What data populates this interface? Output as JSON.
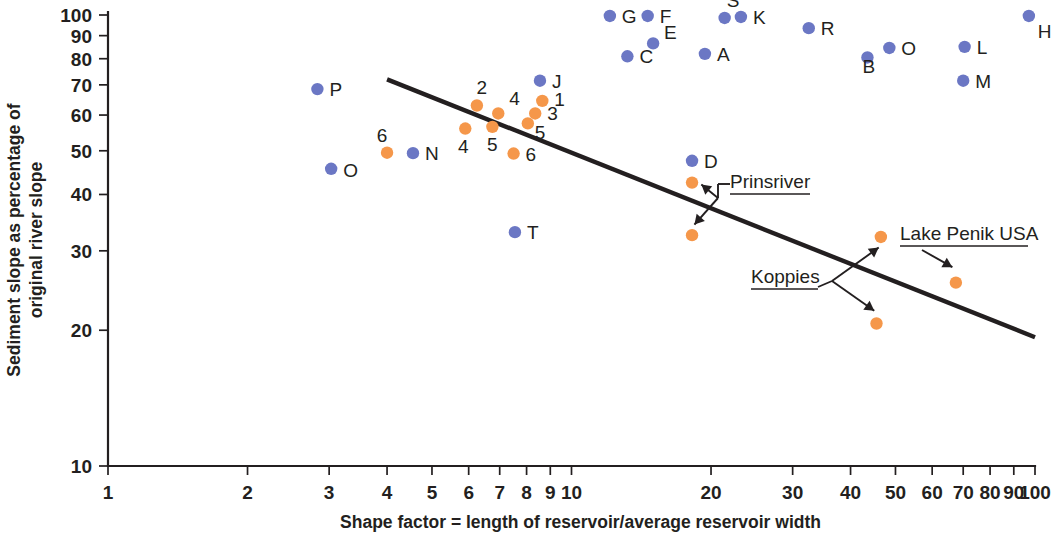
{
  "chart_data": {
    "type": "scatter",
    "title": "",
    "xlabel": "Shape factor = length of reservoir/average reservoir width",
    "ylabel": "Sediment slope as percentage of original river slope",
    "xscale": "log",
    "yscale": "log",
    "xlim": [
      1,
      100
    ],
    "ylim": [
      10,
      100
    ],
    "grid": false,
    "legend": "none",
    "xticks": [
      1,
      2,
      3,
      4,
      5,
      6,
      7,
      8,
      9,
      10,
      20,
      30,
      40,
      50,
      60,
      70,
      80,
      90,
      100
    ],
    "xticklabels": [
      "1",
      "2",
      "3",
      "4",
      "5",
      "6",
      "7",
      "8",
      "9",
      "10",
      "20",
      "30",
      "40",
      "50",
      "60",
      "70",
      "80",
      "90",
      "100"
    ],
    "yticks": [
      10,
      20,
      30,
      40,
      50,
      60,
      70,
      80,
      90,
      100
    ],
    "yticklabels": [
      "10",
      "20",
      "30",
      "40",
      "50",
      "60",
      "70",
      "80",
      "90",
      "100"
    ],
    "colors": {
      "blue": "#6b77c4",
      "orange": "#f5974a",
      "line": "#231f20"
    },
    "series": [
      {
        "name": "Lettered reservoirs",
        "color": "#6b77c4",
        "points": [
          {
            "label": "P",
            "x": 2.83,
            "y": 68.5
          },
          {
            "label": "O",
            "x": 3.03,
            "y": 45.6
          },
          {
            "label": "N",
            "x": 4.55,
            "y": 49.4
          },
          {
            "label": "T",
            "x": 7.55,
            "y": 33.0
          },
          {
            "label": "J",
            "x": 8.55,
            "y": 71.5
          },
          {
            "label": "G",
            "x": 12.1,
            "y": 99.5
          },
          {
            "label": "C",
            "x": 13.2,
            "y": 81.0
          },
          {
            "label": "F",
            "x": 14.6,
            "y": 99.5
          },
          {
            "label": "E",
            "x": 15.0,
            "y": 86.5
          },
          {
            "label": "A",
            "x": 19.4,
            "y": 82.0
          },
          {
            "label": "S",
            "x": 21.4,
            "y": 98.5
          },
          {
            "label": "K",
            "x": 23.2,
            "y": 99.0
          },
          {
            "label": "D",
            "x": 18.2,
            "y": 47.5
          },
          {
            "label": "R",
            "x": 32.5,
            "y": 93.5
          },
          {
            "label": "B",
            "x": 43.5,
            "y": 80.5
          },
          {
            "label": "O",
            "x": 48.5,
            "y": 84.5
          },
          {
            "label": "L",
            "x": 70.5,
            "y": 85.0
          },
          {
            "label": "M",
            "x": 70.0,
            "y": 71.5
          },
          {
            "label": "H",
            "x": 97.0,
            "y": 99.5
          }
        ]
      },
      {
        "name": "Numbered and named reservoirs",
        "color": "#f5974a",
        "points": [
          {
            "label": "6",
            "x": 4.0,
            "y": 49.5
          },
          {
            "label": "4",
            "x": 5.9,
            "y": 56.0
          },
          {
            "label": "2",
            "x": 6.25,
            "y": 63.0
          },
          {
            "label": "5",
            "x": 6.75,
            "y": 56.5
          },
          {
            "label": "4",
            "x": 6.95,
            "y": 60.5
          },
          {
            "label": "6",
            "x": 7.5,
            "y": 49.3
          },
          {
            "label": "5",
            "x": 8.05,
            "y": 57.5
          },
          {
            "label": "3",
            "x": 8.35,
            "y": 60.5
          },
          {
            "label": "1",
            "x": 8.65,
            "y": 64.5
          },
          {
            "label": "Prinsriver",
            "x": 18.2,
            "y": 42.5
          },
          {
            "label": "Prinsriver",
            "x": 18.2,
            "y": 32.5
          },
          {
            "label": "Koppies",
            "x": 46.5,
            "y": 32.2
          },
          {
            "label": "Koppies",
            "x": 45.5,
            "y": 20.7
          },
          {
            "label": "Lake Penik USA",
            "x": 67.5,
            "y": 25.5
          }
        ]
      }
    ],
    "trendline": {
      "label": "regression line",
      "x_start": 4.0,
      "y_start": 72.0,
      "x_end": 100.0,
      "y_end": 19.3
    },
    "annotations": [
      {
        "text": "Prinsriver",
        "note": "double-headed arrow to two stacked orange points"
      },
      {
        "text": "Koppies",
        "note": "two arrows to two orange points"
      },
      {
        "text": "Lake Penik USA",
        "note": "arrow to single orange point"
      }
    ]
  }
}
